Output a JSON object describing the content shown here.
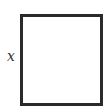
{
  "diagram": {
    "shape": "square",
    "side_label": "x",
    "border_color": "#2a2a2a",
    "fill_color": "#ffffff"
  }
}
